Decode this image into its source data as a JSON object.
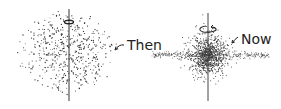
{
  "diagram": {
    "then": {
      "label": "Then",
      "description": "spherical cloud of stars with rotation axis"
    },
    "now": {
      "label": "Now",
      "description": "flattened rotating disk with central bulge"
    }
  },
  "colors": {
    "ink": "#333333",
    "background": "#ffffff"
  }
}
